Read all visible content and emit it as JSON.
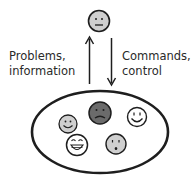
{
  "diagram": {
    "labels": {
      "up_line1": "Problems,",
      "up_line2": "information",
      "down_line1": "Commands,",
      "down_line2": "control"
    },
    "colors": {
      "stroke": "#1e1e1e",
      "face_white": "#ffffff",
      "face_light_gray": "#cfcfcf",
      "face_dark_gray": "#6b6b6b"
    },
    "top_face": {
      "expression": "neutral",
      "fill": "light-gray"
    },
    "arrows": [
      {
        "direction": "up",
        "meaning": "Problems, information"
      },
      {
        "direction": "down",
        "meaning": "Commands, control"
      }
    ],
    "group_faces": [
      {
        "expression": "smiling",
        "fill": "light-gray"
      },
      {
        "expression": "frowning",
        "fill": "dark-gray"
      },
      {
        "expression": "smiling",
        "fill": "white"
      },
      {
        "expression": "laughing",
        "fill": "white"
      },
      {
        "expression": "worried",
        "fill": "light-gray"
      }
    ]
  }
}
